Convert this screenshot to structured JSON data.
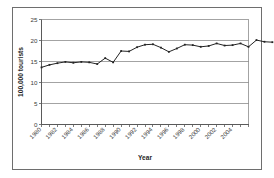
{
  "chart_data": {
    "type": "line",
    "title": "",
    "xlabel": "Year",
    "ylabel": "100,000 tourists",
    "xlim": [
      1980,
      2006
    ],
    "ylim": [
      0,
      25
    ],
    "ytick_values": [
      0,
      5,
      10,
      15,
      20,
      25
    ],
    "ytick_labels": [
      "0",
      "5",
      "10",
      "15",
      "20",
      "25"
    ],
    "xtick_labels": [
      "1980",
      "1982",
      "1984",
      "1986",
      "1988",
      "1990",
      "1992",
      "1994",
      "1996",
      "1998",
      "2000",
      "2002",
      "2004"
    ],
    "xtick_values": [
      1980,
      1982,
      1984,
      1986,
      1988,
      1990,
      1992,
      1994,
      1996,
      1998,
      2000,
      2002,
      2004
    ],
    "grid": "horizontal",
    "legend": "none",
    "marker": "square",
    "x": [
      1980,
      1981,
      1982,
      1983,
      1984,
      1985,
      1986,
      1987,
      1988,
      1989,
      1990,
      1991,
      1992,
      1993,
      1994,
      1995,
      1996,
      1997,
      1998,
      1999,
      2000,
      2001,
      2002,
      2003,
      2004,
      2005,
      2006
    ],
    "values": [
      13.6,
      14.2,
      14.6,
      14.9,
      14.7,
      14.9,
      14.8,
      14.4,
      15.8,
      14.8,
      17.5,
      17.4,
      18.4,
      19.0,
      19.1,
      18.3,
      17.3,
      18.1,
      19.0,
      18.9,
      18.5,
      18.7,
      19.3,
      18.8,
      18.9,
      19.3,
      18.5
    ],
    "values_tail": [
      20.1,
      19.7,
      19.6
    ]
  },
  "axis": {
    "y_title": "100,000 tourists",
    "x_title": "Year"
  }
}
